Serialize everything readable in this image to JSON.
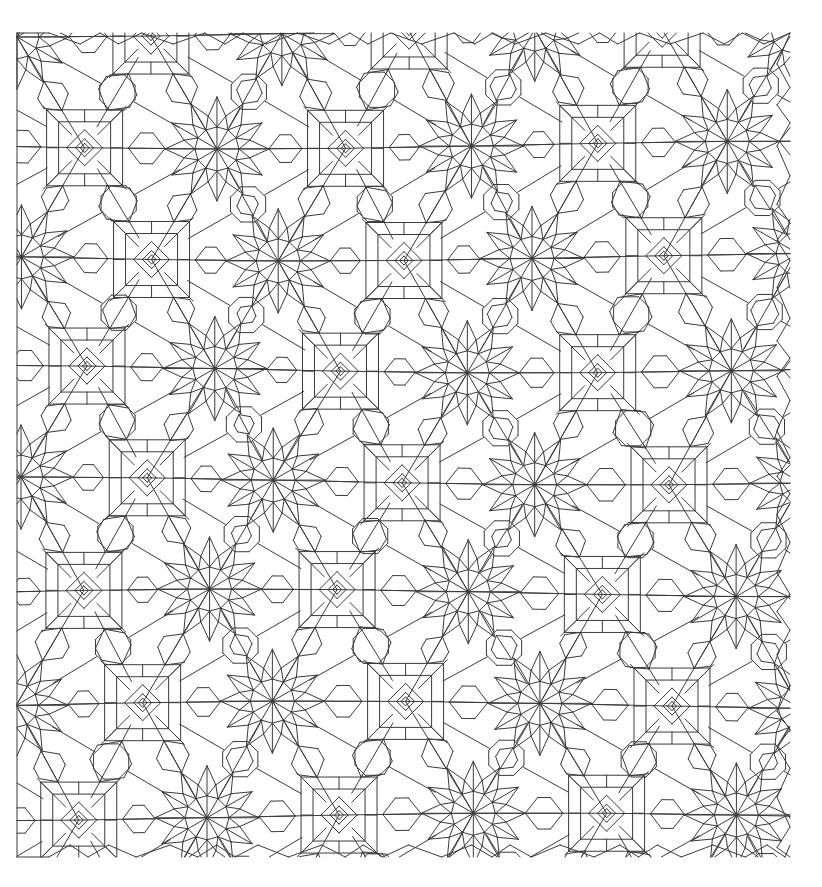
{
  "figure": {
    "title": "Quasi-periodic 12-fold Islamic geometric tiling",
    "type": "line-drawing",
    "background_color": "#ffffff",
    "stroke_color": "#3a3a3a",
    "stroke_width": 1.0,
    "canvas": {
      "width": 822,
      "height": 887
    },
    "pattern_bounds": {
      "x_min": 17,
      "y_min": 33,
      "x_max": 790,
      "y_max": 857
    },
    "symmetry": "12-fold quasi-periodic (Girih / dodecagonal)",
    "motifs": [
      "12-fold rosette star vertex",
      "nested square with rotated inner diamond",
      "regular octagon cell",
      "pentagon cell",
      "rhombus cell",
      "axis-aligned square grid segment"
    ]
  },
  "chart_data": {
    "type": "diagram",
    "title": "Quasi-periodic 12-fold Islamic geometric tiling",
    "xlabel": "",
    "ylabel": "",
    "grid": false,
    "legend": "none",
    "lattice": {
      "star_spacing_x": 130,
      "star_spacing_y": 112,
      "origin_x": 17,
      "origin_y": 33,
      "cols": 6,
      "rows": 8
    },
    "rosette": {
      "rays": 12,
      "outer_radius": 52,
      "inner_radius": 22,
      "ring_radius": 34
    },
    "nested_square": {
      "outer_half": 38,
      "mid_half": 26,
      "diamond_half": 18,
      "inner_half": 9
    }
  }
}
